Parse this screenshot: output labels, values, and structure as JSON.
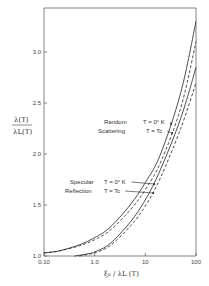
{
  "chart_data": {
    "type": "line",
    "title": "",
    "xlabel": "ξ₀ / λL (T)",
    "ylabel": "λ(T) / λL(T)",
    "xscale": "log",
    "xlim": [
      0.1,
      100
    ],
    "ylim": [
      1.0,
      3.4
    ],
    "grid": false,
    "x_ticks": [
      {
        "value": 0.1,
        "label": "0.10"
      },
      {
        "value": 1,
        "label": "1.0"
      },
      {
        "value": 10,
        "label": "10"
      },
      {
        "value": 100,
        "label": "100"
      }
    ],
    "y_ticks": [
      {
        "value": 1.0,
        "label": "1.0"
      },
      {
        "value": 1.5,
        "label": "1.5"
      },
      {
        "value": 2.0,
        "label": "2.0"
      },
      {
        "value": 2.5,
        "label": "2.5"
      },
      {
        "value": 3.0,
        "label": "3.0"
      }
    ],
    "series": [
      {
        "name": "Random Scattering T = 0° K",
        "style": "solid",
        "x": [
          0.1,
          0.2,
          0.5,
          1,
          2,
          5,
          10,
          20,
          50,
          100
        ],
        "y": [
          1.03,
          1.05,
          1.11,
          1.18,
          1.28,
          1.5,
          1.72,
          2.0,
          2.6,
          3.3
        ]
      },
      {
        "name": "Random Scattering T = Tc",
        "style": "dashed",
        "x": [
          0.1,
          0.2,
          0.5,
          1,
          2,
          5,
          10,
          20,
          50,
          100
        ],
        "y": [
          1.03,
          1.05,
          1.1,
          1.16,
          1.25,
          1.45,
          1.65,
          1.92,
          2.45,
          3.1
        ]
      },
      {
        "name": "Specular Reflection T = 0° K",
        "style": "solid",
        "x": [
          0.4,
          0.7,
          1,
          2,
          5,
          10,
          20,
          50,
          100
        ],
        "y": [
          1.0,
          1.02,
          1.04,
          1.12,
          1.33,
          1.55,
          1.85,
          2.35,
          2.85
        ]
      },
      {
        "name": "Specular Reflection T = Tc",
        "style": "dashed",
        "x": [
          0.5,
          0.8,
          1,
          2,
          5,
          10,
          20,
          50,
          100
        ],
        "y": [
          1.0,
          1.02,
          1.03,
          1.1,
          1.29,
          1.49,
          1.77,
          2.25,
          2.7
        ]
      }
    ],
    "annotations": [
      {
        "text": "Random",
        "x": 104,
        "y": 124
      },
      {
        "text": "Scattering",
        "x": 98,
        "y": 133
      },
      {
        "text": "T = 0° K",
        "x": 143,
        "y": 124,
        "arrow_to_series": 0
      },
      {
        "text": "T = Tc",
        "x": 146,
        "y": 133,
        "arrow_to_series": 1
      },
      {
        "text": "Specular",
        "x": 70,
        "y": 184
      },
      {
        "text": "Reflection",
        "x": 65,
        "y": 193
      },
      {
        "text": "T = 0° K",
        "x": 104,
        "y": 184,
        "arrow_to_series": 2
      },
      {
        "text": "T = Tc",
        "x": 104,
        "y": 193,
        "arrow_to_series": 3
      }
    ]
  },
  "labels": {
    "ylabel_num": "λ(T)",
    "ylabel_den": "λL(T)",
    "xlabel": "ξ₀ / λL (T)",
    "random": "Random",
    "scattering": "Scattering",
    "specular": "Specular",
    "reflection": "Reflection",
    "t0k": "T = 0° K",
    "ttc": "T = Tc"
  }
}
